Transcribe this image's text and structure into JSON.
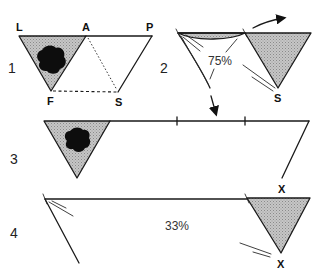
{
  "diagram": {
    "panels": [
      {
        "number": "1",
        "vertex_labels": {
          "L": "L",
          "A": "A",
          "P": "P",
          "F": "F",
          "S": "S"
        },
        "description": "Shaded triangle LAF with dark blob, parallelogram to P and S; dashed F–S, dotted A–S"
      },
      {
        "number": "2",
        "percent": "75%",
        "vertex_labels": {
          "S": "S"
        },
        "description": "Left flap folding with 75%, shaded triangle at right pointing to S, curved arrow right, arrow down"
      },
      {
        "number": "3",
        "vertex_labels": {
          "X": "X"
        },
        "description": "Shaded triangle with blob at left, long top edge with two tick marks, line down to X"
      },
      {
        "number": "4",
        "percent": "33%",
        "vertex_labels": {
          "X_top": "X",
          "X_bottom": "X"
        },
        "description": "Long edge from left vertex, shaded triangle at right pointing to X"
      }
    ],
    "colors": {
      "line": "#1a1a1a",
      "shade": "#bdbdbd",
      "blob": "#0d0d0d",
      "background": "#ffffff"
    }
  }
}
